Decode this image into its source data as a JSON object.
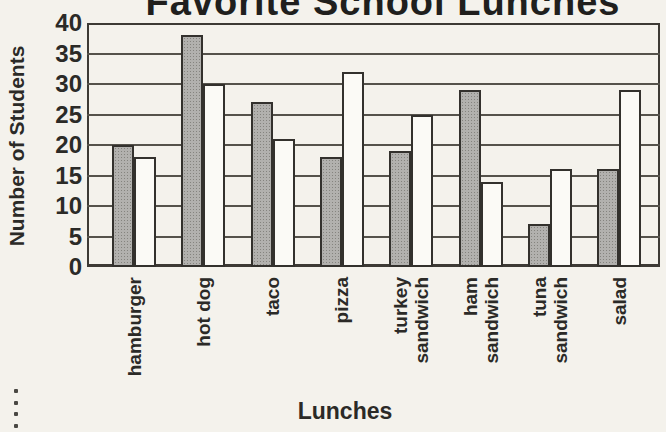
{
  "chart_data": {
    "type": "bar",
    "title": "Favorite School Lunches",
    "xlabel": "Lunches",
    "ylabel": "Number of Students",
    "ylim": [
      0,
      40
    ],
    "ytick_step": 5,
    "yticks": [
      40,
      35,
      30,
      25,
      20,
      15,
      10,
      5,
      0
    ],
    "grid": true,
    "legend": null,
    "categories": [
      "hamburger",
      "hot dog",
      "taco",
      "pizza",
      "turkey sandwich",
      "ham sandwich",
      "tuna sandwich",
      "salad"
    ],
    "series": [
      {
        "name": "shaded-gray-bars",
        "values": [
          20,
          38,
          27,
          18,
          19,
          29,
          7,
          16
        ]
      },
      {
        "name": "white-bars",
        "values": [
          18,
          30,
          21,
          32,
          25,
          14,
          16,
          29
        ]
      }
    ]
  },
  "colors": {
    "background": "#f4f2ec",
    "bar_shaded": "#b2b1ae",
    "bar_shaded_dot": "#85847f",
    "bar_white": "#fbfaf6",
    "outline": "#33312d",
    "gridline": "#55524b",
    "text": "#2b2a27"
  },
  "decoration": {
    "edge_dots_count": 5
  }
}
